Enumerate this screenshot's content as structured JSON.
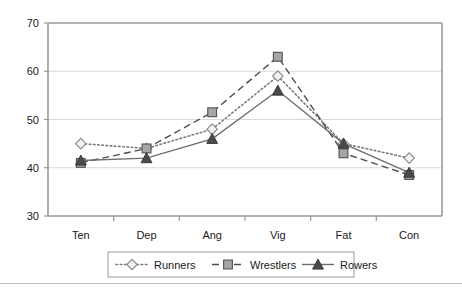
{
  "chart_data": {
    "type": "line",
    "title": "",
    "subtitle": "",
    "xlabel": "",
    "ylabel": "",
    "categories": [
      "Ten",
      "Dep",
      "Ang",
      "Vig",
      "Fat",
      "Con"
    ],
    "ylim": [
      30,
      70
    ],
    "yticks": [
      30,
      40,
      50,
      60,
      70
    ],
    "ytick_labels": [
      "30",
      "40",
      "50",
      "60",
      "70"
    ],
    "grid": true,
    "grid_axis": "y",
    "legend_position": "bottom",
    "series": [
      {
        "name": "Runners",
        "values": [
          45,
          44,
          48,
          59,
          45,
          42
        ],
        "marker": "diamond",
        "line_style": "dotted",
        "color": "#7a7a7a",
        "marker_fill": "#f2f2f2",
        "marker_stroke": "#8c8c8c"
      },
      {
        "name": "Wrestlers",
        "values": [
          41,
          44,
          51.5,
          63,
          43,
          38.5
        ],
        "marker": "square",
        "line_style": "dashed",
        "color": "#4d4d4d",
        "marker_fill": "#a6a6a6",
        "marker_stroke": "#5a5a5a"
      },
      {
        "name": "Rowers",
        "values": [
          41.5,
          42,
          46,
          56,
          45,
          39
        ],
        "marker": "triangle",
        "line_style": "solid",
        "color": "#6e6e6e",
        "marker_fill": "#4a4a4a",
        "marker_stroke": "#3a3a3a"
      }
    ]
  },
  "legend": {
    "items": [
      {
        "label": "Runners"
      },
      {
        "label": "Wrestlers"
      },
      {
        "label": "Rowers"
      }
    ]
  },
  "colors": {
    "gridline": "#d9d9d9",
    "axis": "#9a9a9a",
    "text": "#1a1a1a",
    "background": "#ffffff",
    "footer_rule": "#bdbdbd"
  }
}
